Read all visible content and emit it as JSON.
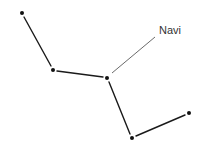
{
  "diagram": {
    "type": "constellation",
    "colors": {
      "line": "#1a1a1a",
      "pointer": "#444444",
      "star": "#111111",
      "label": "#333333"
    },
    "stars": [
      {
        "id": "s1",
        "x": 22,
        "y": 13
      },
      {
        "id": "s2",
        "x": 53,
        "y": 70
      },
      {
        "id": "s3",
        "x": 107,
        "y": 78,
        "name": "Navi"
      },
      {
        "id": "s4",
        "x": 132,
        "y": 138
      },
      {
        "id": "s5",
        "x": 189,
        "y": 113
      }
    ],
    "label": {
      "text": "Navi",
      "x": 159,
      "y": 34,
      "pointer_from": [
        112,
        73
      ],
      "pointer_to": [
        155,
        37
      ]
    }
  }
}
